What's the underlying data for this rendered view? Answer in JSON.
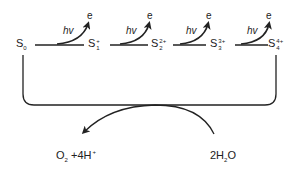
{
  "diagram": {
    "states": [
      {
        "id": "S0",
        "base": "S",
        "sub": "0",
        "sup": ""
      },
      {
        "id": "S1",
        "base": "S",
        "sub": "1",
        "sup": "+"
      },
      {
        "id": "S2",
        "base": "S",
        "sub": "2",
        "sup": "2+"
      },
      {
        "id": "S3",
        "base": "S",
        "sub": "3",
        "sup": "3+"
      },
      {
        "id": "S4",
        "base": "S",
        "sub": "4",
        "sup": "4+"
      }
    ],
    "transitions": [
      {
        "from": "S0",
        "to": "S1",
        "photon": "hv",
        "electron": "e"
      },
      {
        "from": "S1",
        "to": "S2",
        "photon": "hv",
        "electron": "e"
      },
      {
        "from": "S2",
        "to": "S3",
        "photon": "hv",
        "electron": "e"
      },
      {
        "from": "S3",
        "to": "S4",
        "photon": "hv",
        "electron": "e"
      }
    ],
    "products": {
      "label_o2": "O",
      "o2_sub": "2",
      "rest": " +4H",
      "h_sup": "+"
    },
    "reactant": {
      "pre": "2H",
      "sub": "2",
      "post": "O"
    },
    "line_color": "#222222"
  }
}
